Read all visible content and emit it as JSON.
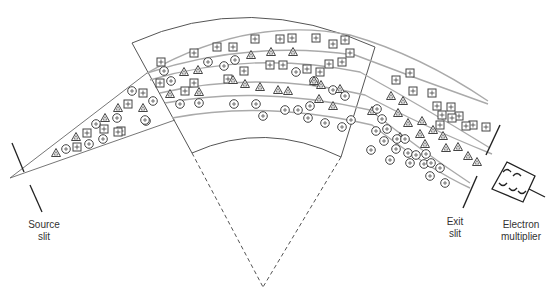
{
  "diagram": {
    "type": "magnetic-sector mass spectrometer",
    "labels": {
      "source_slit": [
        "Source",
        "slit"
      ],
      "exit_slit": [
        "Exit",
        "slit"
      ],
      "electron_multiplier": [
        "Electron",
        "multiplier"
      ]
    },
    "ion_symbols": {
      "square": "boxed-plus (heavy ion)",
      "triangle": "triangle (medium ion)",
      "circle": "circled-plus (light ion)"
    },
    "colors": {
      "line": "#555555",
      "beam": "#aaaaaa",
      "symbol": "#444444",
      "label": "#333333",
      "background": "#ffffff"
    }
  }
}
